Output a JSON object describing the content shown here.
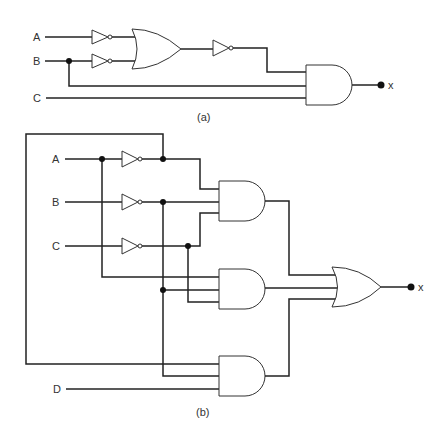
{
  "figure_a": {
    "caption": "(a)",
    "inputs": [
      "A",
      "B",
      "C"
    ],
    "output": "x",
    "gates": [
      {
        "type": "NOT",
        "input": "A"
      },
      {
        "type": "NOT",
        "input": "B"
      },
      {
        "type": "OR",
        "inputs": [
          "A'",
          "B'"
        ]
      },
      {
        "type": "NOT",
        "input": "OR"
      },
      {
        "type": "AND",
        "inputs": [
          "NOT(OR)",
          "B",
          "C"
        ],
        "output": "x"
      }
    ]
  },
  "figure_b": {
    "caption": "(b)",
    "inputs": [
      "A",
      "B",
      "C",
      "D"
    ],
    "output": "x",
    "gates": [
      {
        "type": "NOT",
        "input": "A"
      },
      {
        "type": "NOT",
        "input": "B"
      },
      {
        "type": "NOT",
        "input": "C"
      },
      {
        "type": "AND",
        "id": "and1",
        "inputs": [
          "A'",
          "B'",
          "C'"
        ]
      },
      {
        "type": "AND",
        "id": "and2",
        "inputs": [
          "A",
          "B'",
          "C'"
        ]
      },
      {
        "type": "AND",
        "id": "and3",
        "inputs": [
          "A'",
          "B'",
          "D"
        ]
      },
      {
        "type": "OR",
        "inputs": [
          "and1",
          "and2",
          "and3"
        ],
        "output": "x"
      }
    ]
  },
  "colors": {
    "wire": "#222222",
    "gate_outline": "#333333",
    "background": "#ffffff"
  }
}
